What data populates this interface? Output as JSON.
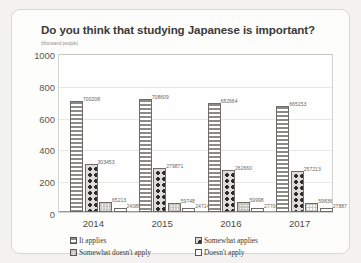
{
  "card": {
    "title": "Do you think that studying Japanese is important?",
    "unit_label": "(thousand people)"
  },
  "legend": {
    "items": [
      {
        "label": "It applies",
        "pattern": "horizontal-stripes"
      },
      {
        "label": "Somewhat applies",
        "pattern": "polka-dots"
      },
      {
        "label": "Somewhat doesn't apply",
        "pattern": "light-checker"
      },
      {
        "label": "Doesn't apply",
        "pattern": "white-outline"
      }
    ]
  },
  "chart_data": {
    "type": "bar",
    "title": "Do you think that studying Japanese is important?",
    "xlabel": "",
    "ylabel": "(thousand people)",
    "ylim": [
      0,
      1000
    ],
    "yticks": [
      1000,
      800,
      600,
      400,
      200,
      0
    ],
    "grid": true,
    "legend_position": "bottom",
    "categories": [
      "2014",
      "2015",
      "2016",
      "2017"
    ],
    "series": [
      {
        "name": "It applies",
        "values": [
          700208,
          708609,
          682664,
          665153
        ]
      },
      {
        "name": "Somewhat applies",
        "values": [
          303453,
          279871,
          262660,
          257213
        ]
      },
      {
        "name": "Somewhat doesn't apply",
        "values": [
          65213,
          59748,
          59998,
          59836
        ]
      },
      {
        "name": "Doesn't apply",
        "values": [
          24089,
          24714,
          27704,
          27887
        ]
      }
    ],
    "value_labels": [
      [
        "700208",
        "303453",
        "65213",
        "24089"
      ],
      [
        "708609",
        "279871",
        "59748",
        "24714"
      ],
      [
        "682664",
        "262660",
        "59998",
        "27704"
      ],
      [
        "665153",
        "257213",
        "59836",
        "27887"
      ]
    ]
  }
}
